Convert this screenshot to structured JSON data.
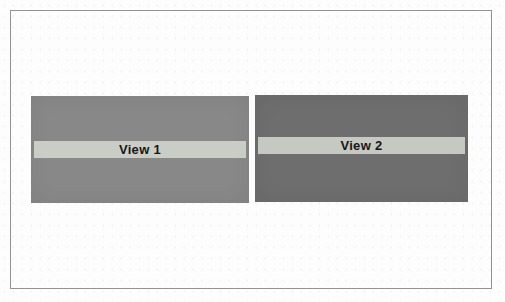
{
  "figure": {
    "background_color": "#fdfdfd",
    "frame_border_color": "#929292",
    "panels": [
      {
        "label": "View 1",
        "panel_color": "#888888",
        "titlebar_color": "#cacdc6",
        "label_color": "#161616"
      },
      {
        "label": "View 2",
        "panel_color": "#6e6e6e",
        "titlebar_color": "#c6c9c2",
        "label_color": "#161616"
      }
    ]
  }
}
